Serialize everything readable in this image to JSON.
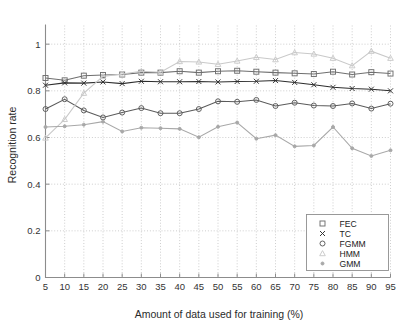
{
  "chart_data": {
    "type": "line",
    "title": "",
    "xlabel": "Amount of data used for training (%)",
    "ylabel": "Recognition rate",
    "x": [
      5,
      10,
      15,
      20,
      25,
      30,
      35,
      40,
      45,
      50,
      55,
      60,
      65,
      70,
      75,
      80,
      85,
      90,
      95
    ],
    "xticklabels": [
      "5",
      "10",
      "15",
      "20",
      "25",
      "30",
      "35",
      "40",
      "45",
      "50",
      "55",
      "60",
      "65",
      "70",
      "75",
      "80",
      "85",
      "90",
      "95"
    ],
    "yticklabels": [
      "0",
      "0.2",
      "0.4",
      "0.6",
      "0.8",
      "1"
    ],
    "yticks": [
      0,
      0.2,
      0.4,
      0.6,
      0.8,
      1
    ],
    "xlim": [
      5,
      95
    ],
    "ylim": [
      0,
      1.08
    ],
    "grid": true,
    "legend_position": "lower right",
    "series": [
      {
        "name": "FEC",
        "marker": "square",
        "color": "#6f6f6f",
        "values": [
          0.855,
          0.845,
          0.865,
          0.868,
          0.87,
          0.878,
          0.878,
          0.884,
          0.878,
          0.884,
          0.886,
          0.882,
          0.878,
          0.875,
          0.872,
          0.882,
          0.87,
          0.88,
          0.874
        ]
      },
      {
        "name": "TC",
        "marker": "x",
        "color": "#2e2e2e",
        "values": [
          0.824,
          0.834,
          0.833,
          0.838,
          0.831,
          0.841,
          0.839,
          0.839,
          0.84,
          0.838,
          0.84,
          0.841,
          0.844,
          0.836,
          0.826,
          0.815,
          0.81,
          0.807,
          0.8
        ]
      },
      {
        "name": "FGMM",
        "marker": "circle",
        "color": "#5a5a5a",
        "values": [
          0.722,
          0.764,
          0.716,
          0.686,
          0.707,
          0.726,
          0.704,
          0.704,
          0.722,
          0.755,
          0.753,
          0.761,
          0.735,
          0.749,
          0.737,
          0.735,
          0.746,
          0.724,
          0.745
        ]
      },
      {
        "name": "HMM",
        "marker": "triangle",
        "color": "#c9c9c9",
        "values": [
          0.598,
          0.678,
          0.79,
          0.862,
          0.872,
          0.884,
          0.88,
          0.926,
          0.924,
          0.914,
          0.928,
          0.944,
          0.934,
          0.964,
          0.958,
          0.94,
          0.908,
          0.97,
          0.94
        ]
      },
      {
        "name": "GMM",
        "marker": "dot",
        "color": "#a8a8a8",
        "values": [
          0.645,
          0.648,
          0.655,
          0.668,
          0.626,
          0.642,
          0.64,
          0.637,
          0.601,
          0.646,
          0.664,
          0.595,
          0.61,
          0.562,
          0.566,
          0.645,
          0.554,
          0.521,
          0.545
        ]
      }
    ]
  },
  "legend": {
    "entries": [
      "FEC",
      "TC",
      "FGMM",
      "HMM",
      "GMM"
    ]
  }
}
